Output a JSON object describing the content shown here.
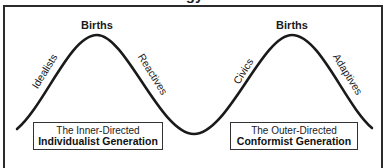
{
  "title_fragment": "…gy…",
  "peaks": [
    {
      "label": "Births"
    },
    {
      "label": "Births"
    }
  ],
  "slopes": [
    {
      "label": "Idealists"
    },
    {
      "label": "Reactives"
    },
    {
      "label": "Civics"
    },
    {
      "label": "Adaptives"
    }
  ],
  "generations": [
    {
      "line1": "The Inner-Directed",
      "line2": "Individualist Generation"
    },
    {
      "line1": "The Outer-Directed",
      "line2": "Conformist Generation"
    }
  ],
  "colors": {
    "stroke": "#1a1a1a",
    "frame": "#2b2b2b",
    "background": "#ffffff"
  }
}
